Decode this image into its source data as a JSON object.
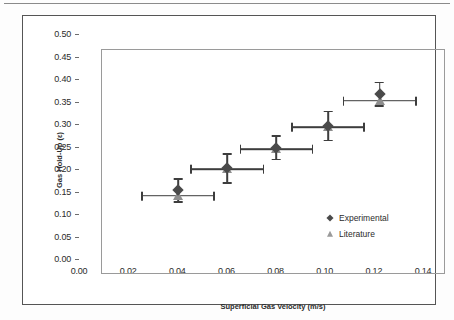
{
  "chart_data": {
    "type": "scatter",
    "title": "",
    "xlabel": "Superficial Gas Velocity (m/s)",
    "ylabel": "Gas Hold-Up (ε)",
    "xlim": [
      0.0,
      0.14
    ],
    "ylim": [
      0.0,
      0.5
    ],
    "xticks": [
      "0.00",
      "0.02",
      "0.04",
      "0.06",
      "0.08",
      "0.10",
      "0.12",
      "0.14"
    ],
    "xtick_values": [
      0.0,
      0.02,
      0.04,
      0.06,
      0.08,
      0.1,
      0.12,
      0.14
    ],
    "yticks": [
      "0.00",
      "0.05",
      "0.10",
      "0.15",
      "0.20",
      "0.25",
      "0.30",
      "0.35",
      "0.40",
      "0.45",
      "0.50"
    ],
    "ytick_values": [
      0.0,
      0.05,
      0.1,
      0.15,
      0.2,
      0.25,
      0.3,
      0.35,
      0.4,
      0.45,
      0.5
    ],
    "grid": false,
    "legend_position": "lower-right-inside",
    "x": [
      0.031,
      0.051,
      0.071,
      0.092,
      0.113
    ],
    "series": [
      {
        "name": "Experimental",
        "marker": "diamond",
        "color": "#4a4a4a",
        "values": [
          0.188,
          0.237,
          0.283,
          0.331,
          0.402
        ],
        "yerr": [
          0.027,
          0.034,
          0.028,
          0.034,
          0.028
        ]
      },
      {
        "name": "Literature",
        "marker": "triangle",
        "color": "#8e8e8e",
        "values": [
          0.176,
          0.235,
          0.28,
          0.328,
          0.387
        ],
        "xerr": [
          0.015,
          0.015,
          0.015,
          0.015,
          0.015
        ]
      }
    ]
  },
  "legend": {
    "items": [
      {
        "label": "Experimental",
        "marker": "diamond"
      },
      {
        "label": "Literature",
        "marker": "triangle"
      }
    ]
  },
  "axes": {
    "x_title": "Superficial Gas Velocity (m/s)",
    "y_title": "Gas Hold-Up (ε)"
  }
}
